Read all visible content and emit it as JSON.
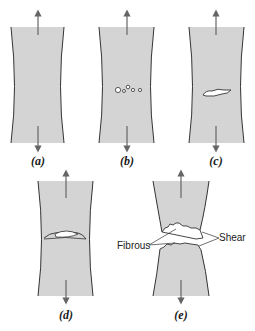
{
  "figure": {
    "colors": {
      "specimen_fill": "#d4d4d4",
      "outline": "#333333",
      "arrow": "#666666",
      "background": "#ffffff"
    },
    "panels": [
      {
        "id": "a",
        "label": "(a)",
        "stage": "initial necking"
      },
      {
        "id": "b",
        "label": "(b)",
        "stage": "small cavity formation"
      },
      {
        "id": "c",
        "label": "(c)",
        "stage": "coalescence of cavities to form a crack"
      },
      {
        "id": "d",
        "label": "(d)",
        "stage": "crack propagation"
      },
      {
        "id": "e",
        "label": "(e)",
        "stage": "final shear fracture"
      }
    ],
    "annotations": {
      "fibrous": "Fibrous",
      "shear": "Shear"
    }
  }
}
